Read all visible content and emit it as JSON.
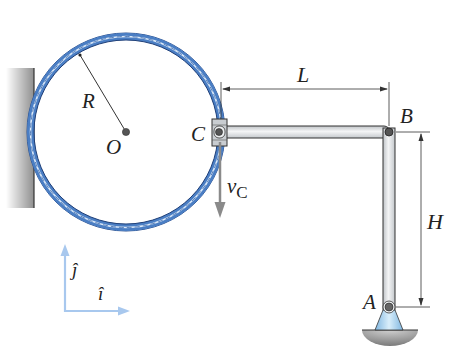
{
  "diagram": {
    "type": "mechanism",
    "labels": {
      "radius": "R",
      "center": "O",
      "collar": "C",
      "velocity_symbol": "v",
      "velocity_subscript": "C",
      "length": "L",
      "pin_b": "B",
      "height": "H",
      "pin_a": "A",
      "unit_j": "ĵ",
      "unit_i": "î"
    },
    "colors": {
      "ring_fill": "#4a7ec4",
      "ring_dark": "#2a4f8e",
      "bar_fill": "#e6e8ea",
      "bar_stroke": "#333333",
      "velocity_arrow": "#8a8a8a",
      "axes": "#a8c8ee",
      "wall": "#9a9a9a",
      "support_blue": "#a9d2ee",
      "ground": "#8c8c8c"
    }
  }
}
